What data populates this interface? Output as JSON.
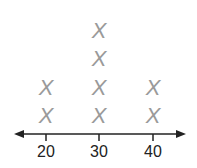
{
  "chart_data": {
    "type": "dot_plot",
    "title": "",
    "xlabel": "",
    "ylabel": "",
    "marker": "X",
    "categories": [
      "20",
      "30",
      "40"
    ],
    "values": [
      2,
      4,
      2
    ],
    "x": [
      20,
      30,
      40
    ],
    "xlim": [
      15,
      45
    ],
    "grid": false,
    "legend": null,
    "axis_arrows": true
  },
  "colors": {
    "marker": "#9a9a9a",
    "axis": "#222222",
    "label": "#222222"
  }
}
